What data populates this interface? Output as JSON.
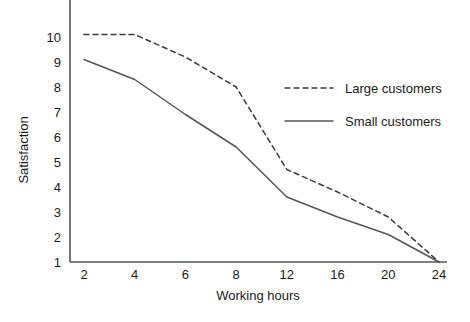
{
  "chart_data": {
    "type": "line",
    "title": "",
    "xlabel": "Working hours",
    "ylabel": "Satisfaction",
    "categories": [
      "2",
      "4",
      "6",
      "8",
      "12",
      "16",
      "20",
      "24"
    ],
    "x_tick_labels": [
      "2",
      "4",
      "6",
      "8",
      "12",
      "16",
      "20",
      "24"
    ],
    "y_tick_labels": [
      "1",
      "2",
      "3",
      "4",
      "5",
      "6",
      "7",
      "8",
      "9",
      "10"
    ],
    "ylim": [
      1,
      10.6
    ],
    "xlim_categorical": true,
    "grid": false,
    "legend_position": "center-right",
    "axes_shown": [
      "left",
      "bottom"
    ],
    "series": [
      {
        "name": "Large customers",
        "style": "dashed",
        "color": "#3b3b3b",
        "values": [
          10.1,
          10.1,
          9.2,
          8.0,
          4.7,
          3.8,
          2.8,
          1.0
        ]
      },
      {
        "name": "Small customers",
        "style": "solid",
        "color": "#555555",
        "values": [
          9.1,
          8.3,
          6.9,
          5.6,
          3.6,
          2.8,
          2.1,
          1.0
        ]
      }
    ]
  },
  "legend": {
    "entries": [
      {
        "label": "Large customers",
        "style": "dashed"
      },
      {
        "label": "Small customers",
        "style": "solid"
      }
    ]
  },
  "colors": {
    "axis": "#555555",
    "text": "#1a1a1a",
    "series_dashed": "#3b3b3b",
    "series_solid": "#555555",
    "background": "#ffffff"
  }
}
